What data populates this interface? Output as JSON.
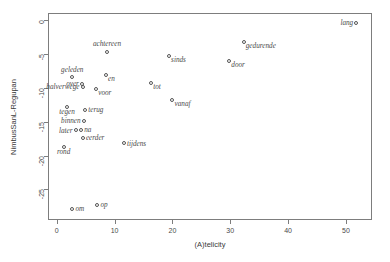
{
  "chart_data": {
    "type": "scatter",
    "title": "",
    "xlabel": "(A)telicity",
    "ylabel": "NimbusSanL-Regupan",
    "xlim": [
      -1.5,
      54.5
    ],
    "ylim": [
      -29.5,
      1.0
    ],
    "grid": false,
    "legend": null,
    "xticks": [
      0,
      10,
      20,
      30,
      40,
      50
    ],
    "xticklabels": [
      "0",
      "10",
      "20",
      "30",
      "40",
      "50"
    ],
    "yticks": [
      0,
      -5,
      -10,
      -15,
      -20,
      -25
    ],
    "yticklabels": [
      "0",
      "-5",
      "-10",
      "-15",
      "-20",
      "-25"
    ],
    "point_style": {
      "marker": "open-circle",
      "color": "#555555",
      "size": 4
    },
    "points": [
      {
        "label": "lang",
        "x": 51.8,
        "y": -0.4,
        "label_pos": "left"
      },
      {
        "label": "gedurende",
        "x": 32.3,
        "y": -3.2,
        "label_pos": "br"
      },
      {
        "label": "achtereen",
        "x": 8.7,
        "y": -4.7,
        "label_pos": "above"
      },
      {
        "label": "sinds",
        "x": 19.4,
        "y": -5.3,
        "label_pos": "br"
      },
      {
        "label": "door",
        "x": 29.8,
        "y": -6.1,
        "label_pos": "br"
      },
      {
        "label": "en",
        "x": 8.5,
        "y": -8.1,
        "label_pos": "br"
      },
      {
        "label": "geleden",
        "x": 2.7,
        "y": -8.4,
        "label_pos": "above"
      },
      {
        "label": "over",
        "x": 4.4,
        "y": -9.4,
        "label_pos": "left"
      },
      {
        "label": "tot",
        "x": 16.3,
        "y": -9.3,
        "label_pos": "br"
      },
      {
        "label": "halverwege",
        "x": 4.5,
        "y": -9.9,
        "label_pos": "left"
      },
      {
        "label": "voor",
        "x": 6.8,
        "y": -10.2,
        "label_pos": "br"
      },
      {
        "label": "vanaf",
        "x": 20.0,
        "y": -11.8,
        "label_pos": "br"
      },
      {
        "label": "tegen",
        "x": 1.8,
        "y": -12.8,
        "label_pos": "below"
      },
      {
        "label": "terug",
        "x": 4.9,
        "y": -13.3,
        "label_pos": "right"
      },
      {
        "label": "binnen",
        "x": 4.7,
        "y": -14.9,
        "label_pos": "left"
      },
      {
        "label": "na",
        "x": 4.2,
        "y": -16.2,
        "label_pos": "right"
      },
      {
        "label": "later",
        "x": 3.3,
        "y": -16.3,
        "label_pos": "left"
      },
      {
        "label": "eerder",
        "x": 4.5,
        "y": -17.4,
        "label_pos": "right"
      },
      {
        "label": "tijdens",
        "x": 11.6,
        "y": -18.2,
        "label_pos": "right"
      },
      {
        "label": "rond",
        "x": 1.2,
        "y": -18.7,
        "label_pos": "below"
      },
      {
        "label": "op",
        "x": 7.0,
        "y": -27.3,
        "label_pos": "right"
      },
      {
        "label": "om",
        "x": 2.7,
        "y": -27.9,
        "label_pos": "right"
      }
    ]
  }
}
